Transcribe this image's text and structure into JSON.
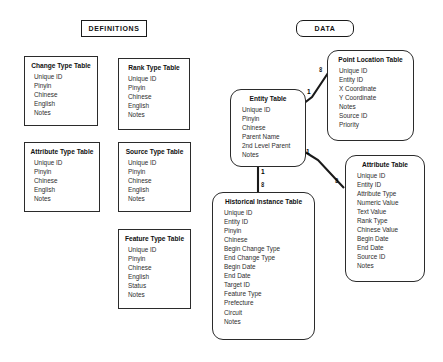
{
  "diagram": {
    "banners": [
      {
        "id": "definitions",
        "label": "DEFINITIONS",
        "shape": "square"
      },
      {
        "id": "data",
        "label": "DATA",
        "shape": "rounded"
      }
    ],
    "tables": [
      {
        "id": "change-type-table",
        "title": "Change Type Table",
        "shape": "sharp",
        "group": "definitions",
        "fields": [
          "Unique ID",
          "Pinyin",
          "Chinese",
          "English",
          "Notes"
        ]
      },
      {
        "id": "rank-type-table",
        "title": "Rank Type Table",
        "shape": "sharp",
        "group": "definitions",
        "fields": [
          "Unique ID",
          "Pinyin",
          "Chinese",
          "English",
          "Notes"
        ]
      },
      {
        "id": "attribute-type-table",
        "title": "Attribute Type Table",
        "shape": "sharp",
        "group": "definitions",
        "fields": [
          "Unique ID",
          "Pinyin",
          "Chinese",
          "English",
          "Notes"
        ]
      },
      {
        "id": "source-type-table",
        "title": "Source Type Table",
        "shape": "sharp",
        "group": "definitions",
        "fields": [
          "Unique ID",
          "Pinyin",
          "Chinese",
          "English",
          "Notes"
        ]
      },
      {
        "id": "feature-type-table",
        "title": "Feature Type Table",
        "shape": "sharp",
        "group": "definitions",
        "fields": [
          "Unique ID",
          "Pinyin",
          "Chinese",
          "English",
          "Status",
          "Notes"
        ]
      },
      {
        "id": "entity-table",
        "title": "Entity Table",
        "shape": "round",
        "group": "data",
        "fields": [
          "Unique ID",
          "Pinyin",
          "Chinese",
          "Parent Name",
          "2nd Level Parent",
          "Notes"
        ]
      },
      {
        "id": "point-location-table",
        "title": "Point Location Table",
        "shape": "round",
        "group": "data",
        "fields": [
          "Unique ID",
          "Entity ID",
          "X Coordinate",
          "Y Coordinate",
          "Notes",
          "Source ID",
          "Priority"
        ]
      },
      {
        "id": "attribute-table",
        "title": "Attribute Table",
        "shape": "round",
        "group": "data",
        "fields": [
          "Unique ID",
          "Entity ID",
          "Attribute Type",
          "Numeric Value",
          "Text Value",
          "Rank Type",
          "Chinese Value",
          "Begin Date",
          "End Date",
          "Source ID",
          "Notes"
        ]
      },
      {
        "id": "historical-instance-table",
        "title": "Historical Instance Table",
        "shape": "round",
        "group": "data",
        "fields": [
          "Unique ID",
          "Entity ID",
          "Pinyin",
          "Chinese",
          "Begin Change Type",
          "End Change Type",
          "Begin Date",
          "End Date",
          "Target ID",
          "Feature Type",
          "Prefecture",
          "Circuit",
          "Notes"
        ]
      }
    ],
    "relationships": [
      {
        "id": "entity-to-point-location",
        "from": "entity-table",
        "to": "point-location-table",
        "from_cardinality": "1",
        "to_cardinality": "∞"
      },
      {
        "id": "entity-to-attribute",
        "from": "entity-table",
        "to": "attribute-table",
        "from_cardinality": "1",
        "to_cardinality": "∞"
      },
      {
        "id": "entity-to-historical-instance",
        "from": "entity-table",
        "to": "historical-instance-table",
        "from_cardinality": "1",
        "to_cardinality": "∞"
      }
    ],
    "colors": {
      "background": "#ffffff",
      "stroke": "#2b2b2b",
      "text": "#2e2e2e",
      "title_text": "#111111"
    }
  }
}
